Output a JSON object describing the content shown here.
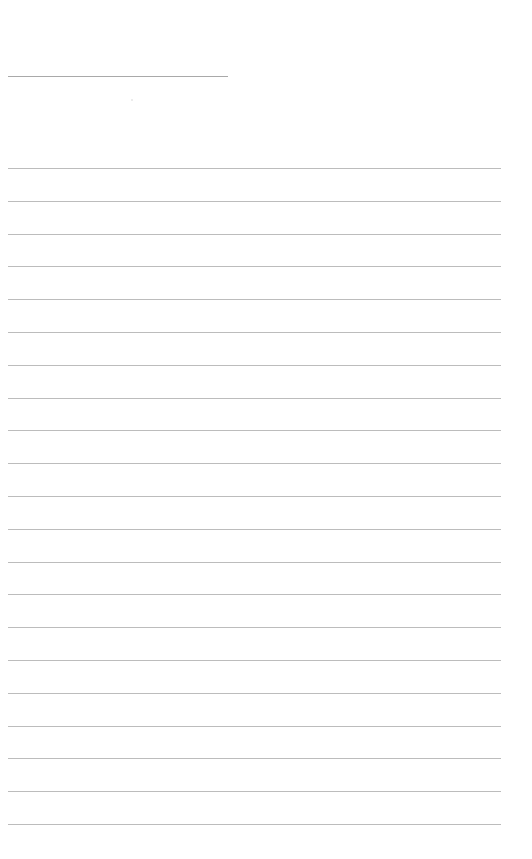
{
  "page": {
    "type": "lined-paper",
    "background": "#ffffff",
    "line_color": "#bcbcbc",
    "title_line": {
      "x": 8,
      "y": 76,
      "width": 220,
      "color": "#a9a9a9",
      "text": ""
    },
    "ruled_lines": {
      "count": 21,
      "x": 8,
      "width": 493,
      "start_y": 168,
      "spacing": 32.8
    }
  }
}
